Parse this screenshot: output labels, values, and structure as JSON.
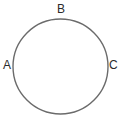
{
  "figure": {
    "type": "geometry-diagram",
    "background_color": "#ffffff",
    "width": 133,
    "height": 127,
    "shape": {
      "name": "circle",
      "stroke_color": "#6b6b6b",
      "stroke_width": 1.4,
      "fill": "none",
      "center_x": 60.5,
      "center_y": 66.5,
      "radius": 47.5
    },
    "labels": [
      {
        "id": "A",
        "text": "A",
        "x": 3,
        "y": 59,
        "color": "#2b2b2b",
        "font_size": 12,
        "position": "left"
      },
      {
        "id": "B",
        "text": "B",
        "x": 57,
        "y": 3,
        "color": "#2b2b2b",
        "font_size": 12,
        "position": "top"
      },
      {
        "id": "C",
        "text": "C",
        "x": 109,
        "y": 59,
        "color": "#2b2b2b",
        "font_size": 12,
        "position": "right"
      }
    ]
  },
  "chart_data": {
    "type": "scatter",
    "title": "",
    "xlabel": "",
    "ylabel": "",
    "grid": false,
    "legend": "none",
    "xlim": [
      0,
      133
    ],
    "ylim": [
      0,
      127
    ],
    "annotations": [
      "A",
      "B",
      "C"
    ],
    "series": [
      {
        "name": "circle-outline",
        "shape": "circle",
        "center": [
          60.5,
          66.5
        ],
        "radius": 47.5,
        "stroke": "#6b6b6b"
      },
      {
        "name": "labeled-points",
        "points": [
          {
            "label": "A",
            "x": 13,
            "y": 66.5
          },
          {
            "label": "B",
            "x": 60.5,
            "y": 19
          },
          {
            "label": "C",
            "x": 108,
            "y": 66.5
          }
        ]
      }
    ]
  }
}
